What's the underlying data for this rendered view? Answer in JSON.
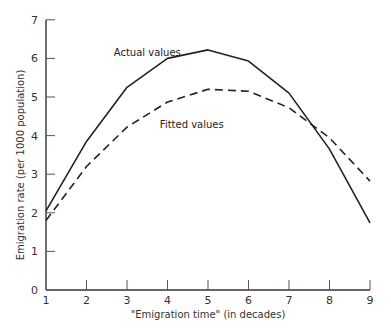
{
  "chart_data": {
    "type": "line",
    "title": "",
    "xlabel": "\"Emigration time\" (in decades)",
    "ylabel": "Emigration rate  (per 1000 population)",
    "x": [
      1,
      2,
      3,
      4,
      5,
      6,
      7,
      8,
      9
    ],
    "xticks": [
      "1",
      "2",
      "3",
      "4",
      "5",
      "6",
      "7",
      "8",
      "9"
    ],
    "yticks": [
      "0",
      "1",
      "2",
      "3",
      "4",
      "5",
      "6",
      "7"
    ],
    "xlim": [
      1,
      9
    ],
    "ylim": [
      0,
      7
    ],
    "grid": false,
    "legend": "none (inline annotations)",
    "series": [
      {
        "name": "Actual values",
        "style": "solid",
        "color": "#222222",
        "values": [
          2.05,
          3.85,
          5.25,
          6.0,
          6.22,
          5.93,
          5.1,
          3.65,
          1.74
        ]
      },
      {
        "name": "Fitted values",
        "style": "dashed",
        "color": "#222222",
        "values": [
          1.8,
          3.2,
          4.22,
          4.87,
          5.2,
          5.15,
          4.72,
          3.94,
          2.82
        ]
      }
    ],
    "annotations": [
      {
        "text": "Actual values",
        "x": 3.5,
        "y": 6.05
      },
      {
        "text": "Fitted values",
        "x": 4.6,
        "y": 4.2
      }
    ]
  }
}
